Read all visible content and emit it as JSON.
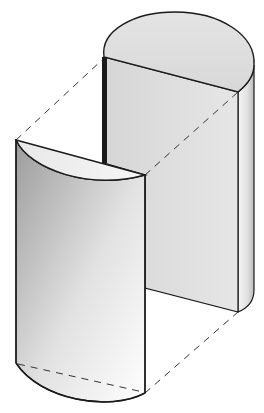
{
  "diagram": {
    "type": "isometric-solid",
    "colors": {
      "background": "#ffffff",
      "outline": "#1a1a1a",
      "face_light": "#f2f2f2",
      "face_mid": "#d9d9d9",
      "face_dark": "#a8a8a8",
      "dash": "#333333"
    },
    "parts": [
      {
        "id": "large-block",
        "label": ""
      },
      {
        "id": "curved-segment",
        "label": ""
      }
    ],
    "construction_lines": 4
  }
}
